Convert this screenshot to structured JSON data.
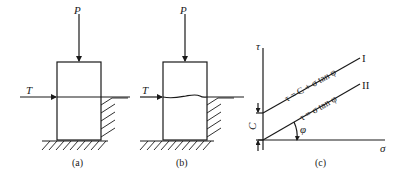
{
  "figure": {
    "panels": [
      {
        "id": "a",
        "caption": "(a)",
        "vertical_load_label": "P",
        "horizontal_force_label": "T",
        "shear_plane": "straight"
      },
      {
        "id": "b",
        "caption": "(b)",
        "vertical_load_label": "P",
        "horizontal_force_label": "T",
        "shear_plane": "wavy"
      },
      {
        "id": "c",
        "caption": "(c)",
        "y_axis_label": "τ",
        "x_axis_label": "σ",
        "intercept_label": "C",
        "angle_label": "φ",
        "lines": [
          {
            "equation": "τ = C + σ tan φ",
            "tag": "I"
          },
          {
            "equation": "τ = σ tan φ",
            "tag": "II"
          }
        ]
      }
    ]
  }
}
